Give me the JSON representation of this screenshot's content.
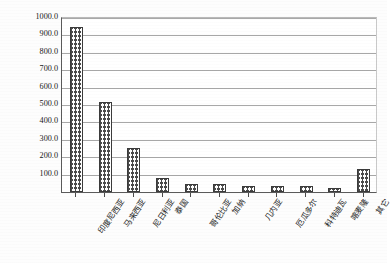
{
  "chart_data": {
    "type": "bar",
    "title": "",
    "xlabel": "",
    "ylabel": "2017年收获面积/万公顷",
    "ylim": [
      0,
      1000
    ],
    "ytick_step": 100,
    "grid": true,
    "legend": false,
    "ytick_labels": [
      "1000.0",
      "900.0",
      "800.0",
      "700.0",
      "600.0",
      "500.0",
      "400.0",
      "300.0",
      "200.0",
      "100.0"
    ],
    "ytick_values": [
      1000,
      900,
      800,
      700,
      600,
      500,
      400,
      300,
      200,
      100
    ],
    "categories": [
      "印度尼西亚",
      "马来西亚",
      "尼日利亚",
      "泰国",
      "哥伦比亚",
      "加纳",
      "几内亚",
      "厄瓜多尔",
      "科特迪瓦",
      "喀麦隆",
      "其它"
    ],
    "values": [
      950.0,
      518.0,
      252.0,
      78.0,
      45.0,
      47.0,
      33.0,
      33.0,
      35.0,
      22.0,
      130.0
    ],
    "series": [
      {
        "name": "2017年收获面积",
        "values": [
          950.0,
          518.0,
          252.0,
          78.0,
          45.0,
          47.0,
          33.0,
          33.0,
          35.0,
          22.0,
          130.0
        ]
      }
    ],
    "bar_fill": "crosshatch",
    "bar_edge_color": "#3b3b3b",
    "grid_color": "#a8a8a8",
    "axis_color": "#5a5a5a"
  }
}
